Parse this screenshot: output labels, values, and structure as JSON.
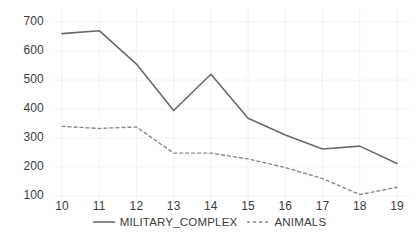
{
  "chart_data": {
    "type": "line",
    "title": "",
    "subtitle": "",
    "xlabel": "",
    "ylabel": "",
    "categories": [
      "10",
      "11",
      "12",
      "13",
      "14",
      "15",
      "16",
      "17",
      "18",
      "19"
    ],
    "x": [
      10,
      11,
      12,
      13,
      14,
      15,
      16,
      17,
      18,
      19
    ],
    "xlim": [
      10,
      19
    ],
    "ylim": [
      100,
      700
    ],
    "y_ticks": [
      100,
      200,
      300,
      400,
      500,
      600,
      700
    ],
    "y_tick_labels": [
      "100",
      "200",
      "300",
      "400",
      "500",
      "600",
      "700"
    ],
    "x_ticks": [
      10,
      11,
      12,
      13,
      14,
      15,
      16,
      17,
      18,
      19
    ],
    "x_tick_labels": [
      "10",
      "11",
      "12",
      "13",
      "14",
      "15",
      "16",
      "17",
      "18",
      "19"
    ],
    "grid": true,
    "grid_color": "#f2f2f2",
    "background": "#ffffff",
    "legend_position": "bottom-center",
    "legend_orientation": "horizontal",
    "series": [
      {
        "name": "MILITARY_COMPLEX",
        "style": "solid",
        "color": "#6a6a6a",
        "width": 1.6,
        "values": [
          660,
          670,
          555,
          395,
          520,
          368,
          310,
          262,
          272,
          212
        ]
      },
      {
        "name": "ANIMALS",
        "style": "dashed",
        "color": "#8a8a8a",
        "width": 1.4,
        "dash": "3 3",
        "values": [
          340,
          333,
          338,
          248,
          248,
          228,
          198,
          160,
          105,
          130
        ]
      }
    ]
  },
  "legend": {
    "items": [
      {
        "label": "MILITARY_COMPLEX",
        "style": "solid",
        "color": "#6a6a6a"
      },
      {
        "label": "ANIMALS",
        "style": "dashed",
        "color": "#8a8a8a"
      }
    ]
  },
  "axes": {
    "y_tick_labels": [
      "700",
      "600",
      "500",
      "400",
      "300",
      "200",
      "100"
    ],
    "x_tick_labels": [
      "10",
      "11",
      "12",
      "13",
      "14",
      "15",
      "16",
      "17",
      "18",
      "19"
    ]
  }
}
